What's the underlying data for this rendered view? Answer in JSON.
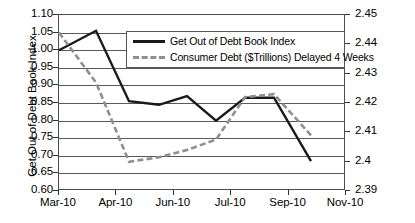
{
  "chart_data": {
    "type": "line",
    "title": "",
    "xlabel": "",
    "x_tick_labels": [
      "Mar-10",
      "Apr-10",
      "Jun-10",
      "Jul-10",
      "Sep-10",
      "Nov-10"
    ],
    "x_points": [
      "Mar-10",
      "Apr-10",
      "May-10",
      "Jun-10",
      "Jul-10",
      "Aug-10",
      "Sep-10",
      "Oct-10",
      "Nov-10"
    ],
    "grid": true,
    "legend_position": "inside-top-center",
    "axes": {
      "left": {
        "label": "Get Out of Debt Book Index",
        "min": 0.6,
        "max": 1.1,
        "step": 0.05,
        "ticks": [
          "1.10",
          "1.05",
          "1.00",
          "0.95",
          "0.90",
          "0.85",
          "0.80",
          "0.75",
          "0.70",
          "0.65",
          "0.60"
        ]
      },
      "right": {
        "label": "US Consumer Debt $Trillions",
        "min": 2.39,
        "max": 2.45,
        "step": 0.01,
        "ticks": [
          "2.45",
          "2.44",
          "2.43",
          "2.42",
          "2.41",
          "2.4",
          "2.39"
        ]
      }
    },
    "series": [
      {
        "name": "Get Out of Debt Book Index",
        "axis": "left",
        "style": "solid",
        "color": "#1a1a1a",
        "values": [
          1.0,
          1.055,
          0.855,
          0.845,
          0.87,
          0.8,
          0.865,
          0.865,
          0.685
        ]
      },
      {
        "name": "Consumer Debt ($Trillions) Delayed 4 Weeks",
        "axis": "right",
        "style": "dashed",
        "color": "#8f8f8f",
        "values": [
          2.444,
          2.427,
          2.4,
          2.4015,
          2.404,
          2.4075,
          2.422,
          2.423,
          2.409
        ]
      }
    ]
  },
  "legend": {
    "items": [
      {
        "label": "Get Out of Debt Book Index",
        "style": "solid"
      },
      {
        "label": "Consumer Debt ($Trillions) Delayed 4 Weeks",
        "style": "dashed"
      }
    ]
  }
}
